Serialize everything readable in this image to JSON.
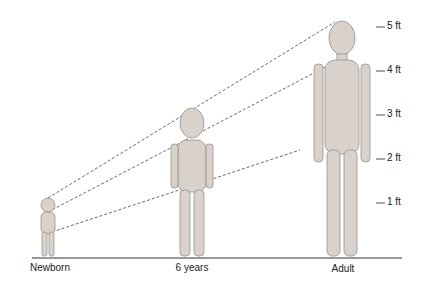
{
  "scale": {
    "unit": "ft",
    "ticks": [
      {
        "label": "5 ft",
        "y": 27
      },
      {
        "label": "4 ft",
        "y": 71
      },
      {
        "label": "3 ft",
        "y": 115
      },
      {
        "label": "2 ft",
        "y": 159
      },
      {
        "label": "1 ft",
        "y": 203
      }
    ]
  },
  "stages": [
    {
      "label": "Newborn",
      "x": 48
    },
    {
      "label": "6 years",
      "x": 192
    },
    {
      "label": "Adult",
      "x": 342
    }
  ],
  "colors": {
    "line": "#333333",
    "figure": "#d9d2cc",
    "figure_stroke": "#9a918a"
  }
}
